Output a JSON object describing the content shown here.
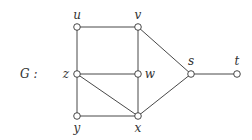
{
  "graph": {
    "name": "G :",
    "nodes": [
      {
        "id": "u",
        "label": "u",
        "x": 77,
        "y": 27,
        "lx": 77,
        "ly": 19
      },
      {
        "id": "v",
        "label": "v",
        "x": 138,
        "y": 27,
        "lx": 138,
        "ly": 19
      },
      {
        "id": "z",
        "label": "z",
        "x": 77,
        "y": 74,
        "lx": 66,
        "ly": 78
      },
      {
        "id": "w",
        "label": "w",
        "x": 138,
        "y": 74,
        "lx": 150,
        "ly": 78
      },
      {
        "id": "y",
        "label": "y",
        "x": 77,
        "y": 116,
        "lx": 77,
        "ly": 132
      },
      {
        "id": "x",
        "label": "x",
        "x": 138,
        "y": 116,
        "lx": 138,
        "ly": 132
      },
      {
        "id": "s",
        "label": "s",
        "x": 191,
        "y": 74,
        "lx": 191,
        "ly": 65
      },
      {
        "id": "t",
        "label": "t",
        "x": 237,
        "y": 74,
        "lx": 237,
        "ly": 65
      }
    ],
    "edges": [
      [
        "u",
        "v"
      ],
      [
        "u",
        "z"
      ],
      [
        "v",
        "w"
      ],
      [
        "v",
        "s"
      ],
      [
        "z",
        "w"
      ],
      [
        "z",
        "y"
      ],
      [
        "z",
        "x"
      ],
      [
        "w",
        "x"
      ],
      [
        "y",
        "x"
      ],
      [
        "x",
        "s"
      ],
      [
        "s",
        "t"
      ]
    ]
  }
}
